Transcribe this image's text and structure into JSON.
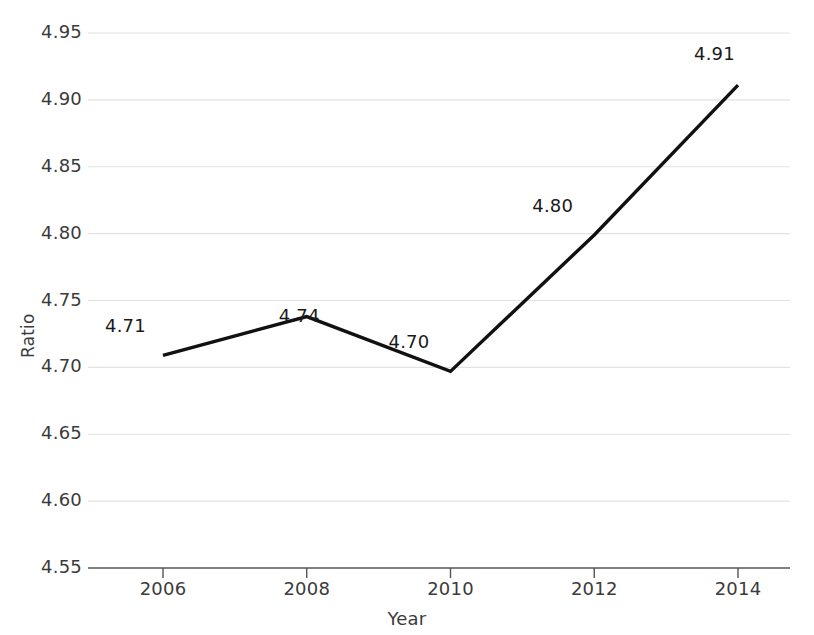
{
  "chart_data": {
    "type": "line",
    "title": "",
    "xlabel": "Year",
    "ylabel": "Ratio",
    "grid": true,
    "legend": false,
    "x": [
      2006,
      2008,
      2010,
      2012,
      2014
    ],
    "xtick_labels": [
      "2006",
      "2008",
      "2010",
      "2012",
      "2014"
    ],
    "xlim": [
      2005,
      2015
    ],
    "values": [
      4.71,
      4.74,
      4.7,
      4.8,
      4.91
    ],
    "plotted_values": [
      4.709,
      4.738,
      4.697,
      4.799,
      4.911
    ],
    "point_labels": [
      "4.71",
      "4.74",
      "4.70",
      "4.80",
      "4.91"
    ],
    "ylim": [
      4.55,
      4.95
    ],
    "ytick_labels": [
      "4.95",
      "4.90",
      "4.85",
      "4.80",
      "4.75",
      "4.70",
      "4.65",
      "4.60",
      "4.55"
    ],
    "yticks": [
      4.95,
      4.9,
      4.85,
      4.8,
      4.75,
      4.7,
      4.65,
      4.6,
      4.55
    ],
    "series": [
      {
        "name": "Ratio",
        "values": [
          4.709,
          4.738,
          4.697,
          4.799,
          4.911
        ],
        "color": "#111111"
      }
    ],
    "colors": {
      "line": "#111111",
      "grid": "#e2e2e2",
      "axis": "#555555",
      "text": "#3b3b3b",
      "background": "#ffffff"
    }
  }
}
